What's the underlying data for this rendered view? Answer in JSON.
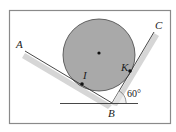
{
  "diagram": {
    "type": "geometry-statics",
    "labels": {
      "A": "A",
      "B": "B",
      "C": "C",
      "I": "I",
      "K": "K",
      "angle": "60°"
    },
    "colors": {
      "circle_fill": "#a9a9a9",
      "shadow": "#d4d4d4",
      "line": "#333333",
      "border": "#8a8a8a"
    }
  }
}
